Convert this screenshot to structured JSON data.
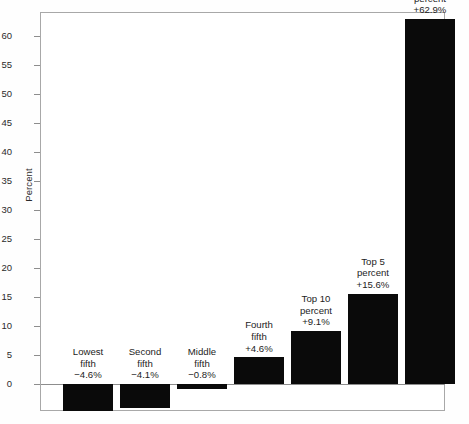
{
  "chart_data": {
    "type": "bar",
    "title": "",
    "subtitle": "",
    "xlabel": "",
    "ylabel": "Percent",
    "ylim": [
      -6,
      63.5
    ],
    "ytick_step": 5,
    "yticks": [
      0,
      5,
      10,
      15,
      20,
      25,
      30,
      35,
      40,
      45,
      50,
      55,
      60
    ],
    "ytick_labels": [
      "0",
      "5",
      "10",
      "15",
      "20",
      "25",
      "30",
      "35",
      "40",
      "45",
      "50",
      "55",
      "60"
    ],
    "grid": false,
    "legend": false,
    "legend_position": "none",
    "bar_color": "#0a0a0a",
    "frame_color": "#a8a8a8",
    "background_color": "#ffffff",
    "categories": [
      "Lowest fifth",
      "Second fifth",
      "Middle fifth",
      "Fourth fifth",
      "Top 10 percent",
      "Top 5 percent",
      "Top 1 percent"
    ],
    "values": [
      -4.6,
      -4.1,
      -0.8,
      4.6,
      9.1,
      15.6,
      62.9
    ],
    "data_labels": [
      "−4.6%",
      "−4.1%",
      "−0.8%",
      "+4.6%",
      "+9.1%",
      "+15.6%",
      "+62.9%"
    ],
    "bars": [
      {
        "name": "lowest-fifth",
        "line1": "Lowest",
        "line2": "fifth",
        "value_label": "−4.6%",
        "value": -4.6
      },
      {
        "name": "second-fifth",
        "line1": "Second",
        "line2": "fifth",
        "value_label": "−4.1%",
        "value": -4.1
      },
      {
        "name": "middle-fifth",
        "line1": "Middle",
        "line2": "fifth",
        "value_label": "−0.8%",
        "value": -0.8
      },
      {
        "name": "fourth-fifth",
        "line1": "Fourth",
        "line2": "fifth",
        "value_label": "+4.6%",
        "value": 4.6
      },
      {
        "name": "top-10-percent",
        "line1": "Top 10",
        "line2": "percent",
        "value_label": "+9.1%",
        "value": 9.1
      },
      {
        "name": "top-5-percent",
        "line1": "Top 5",
        "line2": "percent",
        "value_label": "+15.6%",
        "value": 15.6
      },
      {
        "name": "top-1-percent",
        "line1": "Top 1",
        "line2": "percent",
        "value_label": "+62.9%",
        "value": 62.9
      }
    ]
  }
}
